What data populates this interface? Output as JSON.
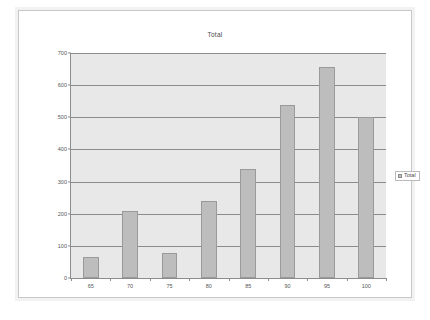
{
  "chart_data": {
    "type": "bar",
    "title": "Total",
    "xlabel": "",
    "ylabel": "",
    "categories": [
      "65",
      "70",
      "75",
      "80",
      "85",
      "90",
      "95",
      "100"
    ],
    "values": [
      65,
      210,
      78,
      240,
      340,
      538,
      658,
      500
    ],
    "series": [
      {
        "name": "Total",
        "values": [
          65,
          210,
          78,
          240,
          340,
          538,
          658,
          500
        ]
      }
    ],
    "ylim": [
      0,
      700
    ],
    "yticks": [
      0,
      100,
      200,
      300,
      400,
      500,
      600,
      700
    ],
    "ytick_labels": [
      "0",
      "100",
      "200",
      "300",
      "400",
      "500",
      "600",
      "700"
    ],
    "grid": true,
    "legend": {
      "position": "right",
      "entries": [
        "Total"
      ]
    },
    "colors": {
      "bar_fill": "#bdbdbd",
      "bar_border": "#9a9a9a",
      "plot_background": "#e8e8e8",
      "gridline": "#8c8c8c",
      "axis": "#8c8c8c",
      "text": "#555555",
      "frame": "#c8c8c8",
      "page_background": "#ffffff"
    }
  },
  "legend": {
    "swatch_icon": "legend-swatch-icon",
    "label": "Total"
  }
}
